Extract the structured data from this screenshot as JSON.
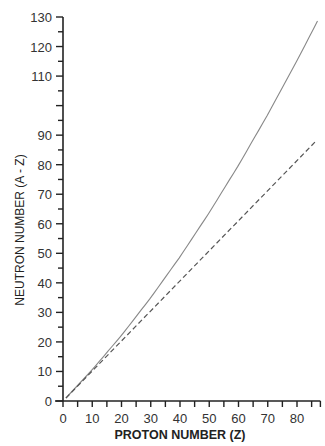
{
  "chart_data": {
    "type": "line",
    "title": "",
    "xlabel": "PROTON NUMBER (Z)",
    "ylabel": "NEUTRON NUMBER (A - Z)",
    "xlim": [
      0,
      88
    ],
    "ylim": [
      0,
      130
    ],
    "x_ticks_major": [
      0,
      10,
      20,
      30,
      40,
      50,
      60,
      70,
      80
    ],
    "x_ticks_minor_step": 5,
    "y_ticks_labeled": [
      0,
      10,
      20,
      30,
      40,
      50,
      60,
      70,
      80,
      90,
      110,
      120,
      130
    ],
    "y_ticks_minor_step": 5,
    "grid": false,
    "legend": null,
    "series": [
      {
        "name": "line of stability (N vs Z)",
        "style": "solid",
        "color": "#888888",
        "x": [
          1,
          10,
          20,
          30,
          40,
          50,
          60,
          70,
          80,
          87
        ],
        "y": [
          1,
          10.6,
          22.2,
          35,
          48.8,
          63.8,
          79.8,
          97,
          115.2,
          128.6
        ]
      },
      {
        "name": "N = Z",
        "style": "dashed",
        "color": "#555555",
        "x": [
          1,
          86.5
        ],
        "y": [
          1,
          88
        ]
      }
    ]
  }
}
